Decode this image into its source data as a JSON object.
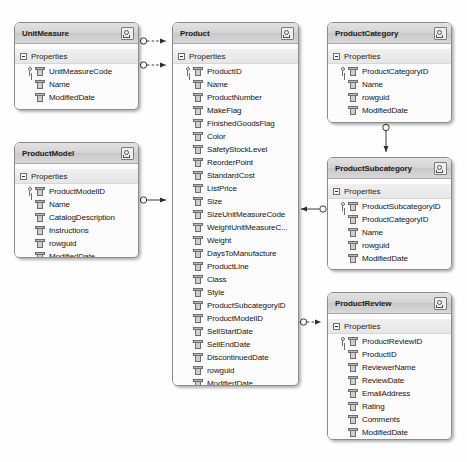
{
  "diagram": {
    "background_color": "#fefefe",
    "entity_border_color": "#8c8c8c",
    "entity_header_color": "#d4d4d4",
    "compartment_label": "Properties",
    "collapse_icon": "collapse-chevron-icon",
    "minus_icon": "minus-box-icon",
    "key_icon": "primary-key-icon",
    "property_icon": "property-icon"
  },
  "entities": [
    {
      "id": "unitmeasure",
      "name": "UnitMeasure",
      "x": 14,
      "y": 22,
      "w": 125,
      "h": 88,
      "compartment": "Properties",
      "attributes": [
        {
          "name": "UnitMeasureCode",
          "pk": true
        },
        {
          "name": "Name",
          "pk": false
        },
        {
          "name": "ModifiedDate",
          "pk": false
        }
      ]
    },
    {
      "id": "productmodel",
      "name": "ProductModel",
      "x": 14,
      "y": 142,
      "w": 125,
      "h": 116,
      "compartment": "Properties",
      "attributes": [
        {
          "name": "ProductModelID",
          "pk": true
        },
        {
          "name": "Name",
          "pk": false
        },
        {
          "name": "CatalogDescription",
          "pk": false
        },
        {
          "name": "Instructions",
          "pk": false
        },
        {
          "name": "rowguid",
          "pk": false
        },
        {
          "name": "ModifiedDate",
          "pk": false
        }
      ]
    },
    {
      "id": "product",
      "name": "Product",
      "x": 172,
      "y": 22,
      "w": 127,
      "h": 364,
      "compartment": "Properties",
      "attributes": [
        {
          "name": "ProductID",
          "pk": true
        },
        {
          "name": "Name",
          "pk": false
        },
        {
          "name": "ProductNumber",
          "pk": false
        },
        {
          "name": "MakeFlag",
          "pk": false
        },
        {
          "name": "FinishedGoodsFlag",
          "pk": false
        },
        {
          "name": "Color",
          "pk": false
        },
        {
          "name": "SafetyStockLevel",
          "pk": false
        },
        {
          "name": "ReorderPoint",
          "pk": false
        },
        {
          "name": "StandardCost",
          "pk": false
        },
        {
          "name": "ListPrice",
          "pk": false
        },
        {
          "name": "Size",
          "pk": false
        },
        {
          "name": "SizeUnitMeasureCode",
          "pk": false
        },
        {
          "name": "WeightUnitMeasureC...",
          "pk": false
        },
        {
          "name": "Weight",
          "pk": false
        },
        {
          "name": "DaysToManufacture",
          "pk": false
        },
        {
          "name": "ProductLine",
          "pk": false
        },
        {
          "name": "Class",
          "pk": false
        },
        {
          "name": "Style",
          "pk": false
        },
        {
          "name": "ProductSubcategoryID",
          "pk": false
        },
        {
          "name": "ProductModelID",
          "pk": false
        },
        {
          "name": "SellStartDate",
          "pk": false
        },
        {
          "name": "SellEndDate",
          "pk": false
        },
        {
          "name": "DiscontinuedDate",
          "pk": false
        },
        {
          "name": "rowguid",
          "pk": false
        },
        {
          "name": "ModifiedDate",
          "pk": false
        }
      ]
    },
    {
      "id": "productcategory",
      "name": "ProductCategory",
      "x": 327,
      "y": 22,
      "w": 125,
      "h": 101,
      "compartment": "Properties",
      "attributes": [
        {
          "name": "ProductCategoryID",
          "pk": true
        },
        {
          "name": "Name",
          "pk": false
        },
        {
          "name": "rowguid",
          "pk": false
        },
        {
          "name": "ModifiedDate",
          "pk": false
        }
      ]
    },
    {
      "id": "productsubcategory",
      "name": "ProductSubcategory",
      "x": 327,
      "y": 157,
      "w": 125,
      "h": 113,
      "compartment": "Properties",
      "attributes": [
        {
          "name": "ProductSubcategoryID",
          "pk": true
        },
        {
          "name": "ProductCategoryID",
          "pk": false
        },
        {
          "name": "Name",
          "pk": false
        },
        {
          "name": "rowguid",
          "pk": false
        },
        {
          "name": "ModifiedDate",
          "pk": false
        }
      ]
    },
    {
      "id": "productreview",
      "name": "ProductReview",
      "x": 327,
      "y": 292,
      "w": 125,
      "h": 148,
      "compartment": "Properties",
      "attributes": [
        {
          "name": "ProductReviewID",
          "pk": true
        },
        {
          "name": "ProductID",
          "pk": false
        },
        {
          "name": "ReviewerName",
          "pk": false
        },
        {
          "name": "ReviewDate",
          "pk": false
        },
        {
          "name": "EmailAddress",
          "pk": false
        },
        {
          "name": "Rating",
          "pk": false
        },
        {
          "name": "Comments",
          "pk": false
        },
        {
          "name": "ModifiedDate",
          "pk": false
        }
      ]
    }
  ],
  "connectors": [
    {
      "id": "unitmeasure-to-product-1",
      "from": "UnitMeasure",
      "to": "Product",
      "style": "dashed"
    },
    {
      "id": "unitmeasure-to-product-2",
      "from": "UnitMeasure",
      "to": "Product",
      "style": "dashed"
    },
    {
      "id": "productmodel-to-product",
      "from": "ProductModel",
      "to": "Product",
      "style": "solid"
    },
    {
      "id": "productcategory-to-productsubcategory",
      "from": "ProductCategory",
      "to": "ProductSubcategory",
      "style": "solid"
    },
    {
      "id": "productsubcategory-to-product",
      "from": "ProductSubcategory",
      "to": "Product",
      "style": "solid"
    },
    {
      "id": "product-to-productreview",
      "from": "Product",
      "to": "ProductReview",
      "style": "dashed"
    }
  ]
}
